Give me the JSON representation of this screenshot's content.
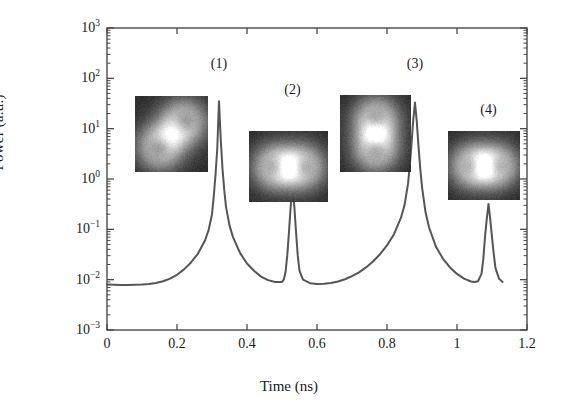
{
  "chart_data": {
    "type": "line",
    "title": "",
    "xlabel": "Time (ns)",
    "ylabel": "Power (a.u.)",
    "xlim": [
      0,
      1.2
    ],
    "ylim": [
      0.001,
      1000
    ],
    "yscale": "log",
    "grid": false,
    "legend": null,
    "xticks": [
      "0",
      "0.2",
      "0.4",
      "0.6",
      "0.8",
      "1",
      "1.2"
    ],
    "xtick_values": [
      0,
      0.2,
      0.4,
      0.6,
      0.8,
      1.0,
      1.2
    ],
    "ytick_labels": [
      "10^3",
      "10^2",
      "10^1",
      "10^0",
      "10^-1",
      "10^-2",
      "10^-3"
    ],
    "ytick_mantissa": [
      "10",
      "10",
      "10",
      "10",
      "10",
      "10",
      "10"
    ],
    "ytick_exponents": [
      "3",
      "2",
      "1",
      "0",
      "-1",
      "-2",
      "-3"
    ],
    "ytick_values": [
      1000,
      100,
      10,
      1,
      0.1,
      0.01,
      0.001
    ],
    "series": [
      {
        "name": "Power trace",
        "color": "#555555",
        "baseline": 0.008,
        "x": [
          0.0,
          0.02,
          0.04,
          0.06,
          0.08,
          0.1,
          0.12,
          0.14,
          0.16,
          0.18,
          0.2,
          0.22,
          0.24,
          0.26,
          0.28,
          0.29,
          0.3,
          0.305,
          0.31,
          0.315,
          0.32,
          0.325,
          0.33,
          0.335,
          0.34,
          0.35,
          0.36,
          0.38,
          0.4,
          0.42,
          0.44,
          0.46,
          0.48,
          0.5,
          0.505,
          0.51,
          0.515,
          0.52,
          0.525,
          0.53,
          0.535,
          0.54,
          0.545,
          0.55,
          0.56,
          0.58,
          0.6,
          0.62,
          0.64,
          0.66,
          0.68,
          0.7,
          0.72,
          0.74,
          0.76,
          0.78,
          0.8,
          0.82,
          0.84,
          0.85,
          0.86,
          0.865,
          0.87,
          0.875,
          0.88,
          0.885,
          0.89,
          0.895,
          0.9,
          0.91,
          0.92,
          0.94,
          0.96,
          0.98,
          1.0,
          1.02,
          1.04,
          1.05,
          1.06,
          1.07,
          1.075,
          1.08,
          1.085,
          1.09,
          1.095,
          1.1,
          1.105,
          1.11,
          1.12,
          1.13
        ],
        "y": [
          0.008,
          0.0079,
          0.0078,
          0.0078,
          0.0079,
          0.008,
          0.0082,
          0.0086,
          0.0093,
          0.0105,
          0.0125,
          0.016,
          0.022,
          0.033,
          0.06,
          0.095,
          0.2,
          0.45,
          1.2,
          4.0,
          35.0,
          6.0,
          1.6,
          0.6,
          0.28,
          0.12,
          0.07,
          0.034,
          0.021,
          0.015,
          0.0115,
          0.0098,
          0.009,
          0.009,
          0.01,
          0.014,
          0.03,
          0.09,
          0.3,
          0.6,
          0.3,
          0.09,
          0.03,
          0.015,
          0.01,
          0.0085,
          0.0082,
          0.0083,
          0.0086,
          0.0092,
          0.0102,
          0.0118,
          0.014,
          0.0175,
          0.023,
          0.032,
          0.048,
          0.08,
          0.17,
          0.3,
          0.8,
          1.8,
          5.0,
          15.0,
          33.0,
          14.0,
          4.5,
          1.6,
          0.7,
          0.22,
          0.11,
          0.045,
          0.026,
          0.0175,
          0.013,
          0.0105,
          0.0092,
          0.009,
          0.0093,
          0.013,
          0.025,
          0.07,
          0.16,
          0.32,
          0.16,
          0.07,
          0.032,
          0.017,
          0.0105,
          0.009
        ]
      }
    ],
    "peak_annotations": [
      {
        "label": "(1)",
        "time": 0.32,
        "peak_power": 35,
        "label_y_value": 180
      },
      {
        "label": "(2)",
        "time": 0.53,
        "peak_power": 0.6,
        "label_y_value": 55
      },
      {
        "label": "(3)",
        "time": 0.88,
        "peak_power": 33,
        "label_y_value": 180
      },
      {
        "label": "(4)",
        "time": 1.09,
        "peak_power": 0.32,
        "label_y_value": 22
      }
    ],
    "insets": [
      {
        "name": "mode-image-1",
        "mode": "two-lobe-diagonal",
        "orientation": "diagonal",
        "x_px": 135,
        "y_px": 96,
        "w_px": 73,
        "h_px": 76
      },
      {
        "name": "mode-image-2",
        "mode": "two-lobe-horizontal",
        "orientation": "horizontal",
        "x_px": 249,
        "y_px": 131,
        "w_px": 79,
        "h_px": 71
      },
      {
        "name": "mode-image-3",
        "mode": "two-lobe-vertical",
        "orientation": "vertical",
        "x_px": 340,
        "y_px": 95,
        "w_px": 71,
        "h_px": 77
      },
      {
        "name": "mode-image-4",
        "mode": "two-lobe-horizontal",
        "orientation": "horizontal",
        "x_px": 448,
        "y_px": 131,
        "w_px": 72,
        "h_px": 69
      }
    ],
    "axes_box_px": {
      "left": 107,
      "right": 527,
      "top": 28,
      "bottom": 330
    },
    "axis_color": "#4a4a4a"
  }
}
